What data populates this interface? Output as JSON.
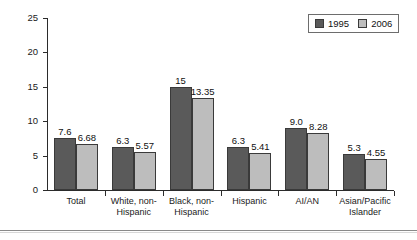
{
  "chart_data": {
    "type": "bar",
    "title": "",
    "subtitle": "",
    "xlabel": "",
    "ylabel": "",
    "ylim": [
      0,
      25
    ],
    "yticks": [
      0,
      5,
      10,
      15,
      20,
      25
    ],
    "ytick_labels": [
      "0",
      "5",
      "10",
      "15",
      "20",
      "25"
    ],
    "grid": false,
    "legend_position": "top-right",
    "categories": [
      "Total",
      "White, non-Hispanic",
      "Black, non-Hispanic",
      "Hispanic",
      "AI/AN",
      "Asian/Pacific Islander"
    ],
    "category_lines": [
      [
        "Total"
      ],
      [
        "White, non-",
        "Hispanic"
      ],
      [
        "Black, non-",
        "Hispanic"
      ],
      [
        "Hispanic"
      ],
      [
        "AI/AN"
      ],
      [
        "Asian/Pacific",
        "Islander"
      ]
    ],
    "series": [
      {
        "name": "1995",
        "color": "#5a5a5a",
        "values": [
          7.6,
          6.3,
          15,
          6.3,
          9.0,
          5.3
        ],
        "labels": [
          "7.6",
          "6.3",
          "15",
          "6.3",
          "9.0",
          "5.3"
        ]
      },
      {
        "name": "2006",
        "color": "#bdbdbd",
        "values": [
          6.68,
          5.57,
          13.35,
          5.41,
          8.28,
          4.55
        ],
        "labels": [
          "6.68",
          "5.57",
          "13.35",
          "5.41",
          "8.28",
          "4.55"
        ]
      }
    ]
  },
  "legend": {
    "entries": [
      {
        "label": "1995",
        "swatch": "legend-swatch-1995"
      },
      {
        "label": "2006",
        "swatch": "legend-swatch-2006"
      }
    ]
  },
  "colors": {
    "series_1995": "#5a5a5a",
    "series_2006": "#bdbdbd",
    "axis": "#2b2b2b",
    "background": "#ffffff"
  }
}
